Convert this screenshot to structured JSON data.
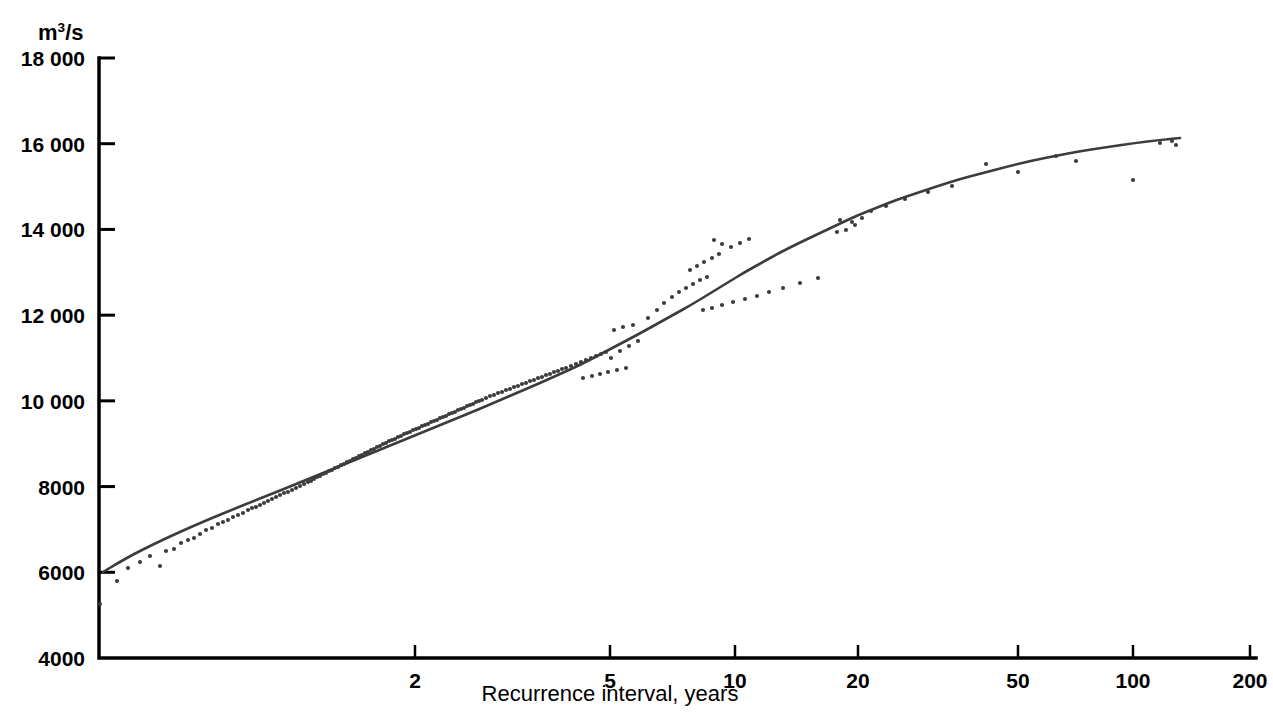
{
  "chart_data": {
    "type": "scatter",
    "title": "",
    "subtitle": "",
    "xlabel": "Recurrence interval, years",
    "ylabel": "m3/s",
    "ylabel_html": "m<sup>3</sup>/s",
    "ylabel_unit_base": "m",
    "ylabel_unit_exp": "3",
    "ylabel_unit_tail": "/s",
    "x_scale": "gumbel-probability",
    "y_scale": "linear",
    "grid": false,
    "legend": null,
    "legend_position": "none",
    "ylim": [
      4000,
      18000
    ],
    "xlim": [
      1.02,
      200
    ],
    "y_ticks": [
      {
        "value": 18000,
        "label": "18 000"
      },
      {
        "value": 16000,
        "label": "16 000"
      },
      {
        "value": 14000,
        "label": "14 000"
      },
      {
        "value": 12000,
        "label": "12 000"
      },
      {
        "value": 10000,
        "label": "10 000"
      },
      {
        "value": 8000,
        "label": "8000"
      },
      {
        "value": 6000,
        "label": "6000"
      },
      {
        "value": 4000,
        "label": "4000"
      }
    ],
    "x_ticks": [
      {
        "value": 2,
        "label": "2",
        "px": 415
      },
      {
        "value": 5,
        "label": "5",
        "px": 610
      },
      {
        "value": 10,
        "label": "10",
        "px": 735
      },
      {
        "value": 20,
        "label": "20",
        "px": 858
      },
      {
        "value": 50,
        "label": "50",
        "px": 1018
      },
      {
        "value": 100,
        "label": "100",
        "px": 1133
      },
      {
        "value": 200,
        "label": "200",
        "px": 1250
      }
    ],
    "series": [
      {
        "name": "Fitted frequency curve",
        "type": "line",
        "color": "#3c3c3c",
        "points_px": [
          [
            103,
            572
          ],
          [
            118,
            563
          ],
          [
            134,
            554
          ],
          [
            152,
            545
          ],
          [
            171,
            536
          ],
          [
            191,
            527
          ],
          [
            212,
            518
          ],
          [
            234,
            509
          ],
          [
            256,
            500
          ],
          [
            279,
            491
          ],
          [
            301,
            482
          ],
          [
            323,
            473
          ],
          [
            345,
            464
          ],
          [
            367,
            455
          ],
          [
            389,
            446
          ],
          [
            411,
            437
          ],
          [
            433,
            428
          ],
          [
            455,
            419
          ],
          [
            477,
            410
          ],
          [
            498,
            401
          ],
          [
            519,
            392
          ],
          [
            540,
            383
          ],
          [
            560,
            374
          ],
          [
            580,
            365
          ],
          [
            599,
            355
          ],
          [
            618,
            345
          ],
          [
            637,
            335
          ],
          [
            655,
            325
          ],
          [
            673,
            315
          ],
          [
            691,
            305
          ],
          [
            709,
            294
          ],
          [
            727,
            283
          ],
          [
            745,
            272
          ],
          [
            763,
            262
          ],
          [
            781,
            252
          ],
          [
            799,
            243
          ],
          [
            818,
            234
          ],
          [
            837,
            225
          ],
          [
            856,
            216
          ],
          [
            876,
            208
          ],
          [
            896,
            200
          ],
          [
            917,
            193
          ],
          [
            938,
            186
          ],
          [
            960,
            179
          ],
          [
            983,
            173
          ],
          [
            1006,
            167
          ],
          [
            1030,
            161
          ],
          [
            1055,
            156
          ],
          [
            1081,
            151
          ],
          [
            1108,
            147
          ],
          [
            1135,
            143
          ],
          [
            1160,
            140
          ],
          [
            1180,
            138
          ]
        ],
        "values_at_xticks": [
          {
            "x": 2,
            "y": 9300
          },
          {
            "x": 5,
            "y": 11790
          },
          {
            "x": 10,
            "y": 13835
          },
          {
            "x": 20,
            "y": 14530
          },
          {
            "x": 50,
            "y": 15370
          },
          {
            "x": 100,
            "y": 15700
          },
          {
            "x": 140,
            "y": 16100
          }
        ],
        "y_start": 6090,
        "y_end": 16120
      },
      {
        "name": "Annual peak discharge observations",
        "type": "scatter",
        "color": "#3c3c3c",
        "marker": "dot",
        "marker_size_px": 3,
        "n_points": 168,
        "points_px": [
          [
            100,
            604
          ],
          [
            117,
            581
          ],
          [
            128,
            568
          ],
          [
            140,
            562
          ],
          [
            150,
            556
          ],
          [
            160,
            566
          ],
          [
            166,
            551
          ],
          [
            174,
            549
          ],
          [
            181,
            543
          ],
          [
            188,
            540
          ],
          [
            194,
            538
          ],
          [
            200,
            534
          ],
          [
            206,
            530
          ],
          [
            212,
            528
          ],
          [
            218,
            524
          ],
          [
            223,
            522
          ],
          [
            228,
            520
          ],
          [
            233,
            517
          ],
          [
            238,
            515
          ],
          [
            243,
            513
          ],
          [
            248,
            510
          ],
          [
            252,
            508
          ],
          [
            256,
            507
          ],
          [
            260,
            505
          ],
          [
            264,
            503
          ],
          [
            268,
            501
          ],
          [
            272,
            499
          ],
          [
            276,
            497
          ],
          [
            280,
            495
          ],
          [
            284,
            493
          ],
          [
            288,
            492
          ],
          [
            292,
            490
          ],
          [
            296,
            488
          ],
          [
            300,
            486
          ],
          [
            304,
            484
          ],
          [
            308,
            482
          ],
          [
            311,
            481
          ],
          [
            314,
            479
          ],
          [
            317,
            477
          ],
          [
            320,
            476
          ],
          [
            323,
            474
          ],
          [
            326,
            473
          ],
          [
            329,
            471
          ],
          [
            332,
            470
          ],
          [
            335,
            468
          ],
          [
            338,
            467
          ],
          [
            341,
            465
          ],
          [
            344,
            464
          ],
          [
            347,
            462
          ],
          [
            350,
            461
          ],
          [
            353,
            459
          ],
          [
            356,
            458
          ],
          [
            359,
            456
          ],
          [
            362,
            455
          ],
          [
            365,
            453
          ],
          [
            368,
            452
          ],
          [
            371,
            450
          ],
          [
            374,
            449
          ],
          [
            377,
            447
          ],
          [
            380,
            446
          ],
          [
            383,
            444
          ],
          [
            386,
            443
          ],
          [
            389,
            441
          ],
          [
            392,
            440
          ],
          [
            395,
            439
          ],
          [
            398,
            437
          ],
          [
            401,
            436
          ],
          [
            404,
            434
          ],
          [
            407,
            433
          ],
          [
            410,
            432
          ],
          [
            413,
            430
          ],
          [
            416,
            429
          ],
          [
            419,
            428
          ],
          [
            422,
            426
          ],
          [
            425,
            425
          ],
          [
            428,
            424
          ],
          [
            431,
            422
          ],
          [
            434,
            421
          ],
          [
            437,
            420
          ],
          [
            440,
            418
          ],
          [
            443,
            417
          ],
          [
            446,
            416
          ],
          [
            449,
            414
          ],
          [
            452,
            413
          ],
          [
            455,
            412
          ],
          [
            458,
            410
          ],
          [
            461,
            409
          ],
          [
            464,
            408
          ],
          [
            467,
            406
          ],
          [
            470,
            405
          ],
          [
            473,
            404
          ],
          [
            476,
            402
          ],
          [
            479,
            401
          ],
          [
            482,
            400
          ],
          [
            486,
            398
          ],
          [
            490,
            396
          ],
          [
            494,
            395
          ],
          [
            498,
            393
          ],
          [
            502,
            392
          ],
          [
            506,
            390
          ],
          [
            510,
            389
          ],
          [
            514,
            387
          ],
          [
            518,
            386
          ],
          [
            522,
            384
          ],
          [
            526,
            383
          ],
          [
            530,
            381
          ],
          [
            534,
            380
          ],
          [
            538,
            378
          ],
          [
            542,
            377
          ],
          [
            546,
            375
          ],
          [
            550,
            374
          ],
          [
            554,
            372
          ],
          [
            558,
            371
          ],
          [
            562,
            369
          ],
          [
            566,
            368
          ],
          [
            571,
            366
          ],
          [
            576,
            364
          ],
          [
            581,
            362
          ],
          [
            586,
            360
          ],
          [
            591,
            358
          ],
          [
            596,
            356
          ],
          [
            601,
            354
          ],
          [
            606,
            352
          ],
          [
            583,
            378
          ],
          [
            592,
            376
          ],
          [
            600,
            374
          ],
          [
            608,
            372
          ],
          [
            617,
            370
          ],
          [
            626,
            368
          ],
          [
            611,
            358
          ],
          [
            620,
            351
          ],
          [
            629,
            346
          ],
          [
            638,
            341
          ],
          [
            614,
            330
          ],
          [
            623,
            327
          ],
          [
            633,
            325
          ],
          [
            648,
            318
          ],
          [
            657,
            310
          ],
          [
            664,
            303
          ],
          [
            672,
            297
          ],
          [
            679,
            292
          ],
          [
            686,
            288
          ],
          [
            693,
            284
          ],
          [
            700,
            280
          ],
          [
            707,
            277
          ],
          [
            690,
            270
          ],
          [
            697,
            266
          ],
          [
            704,
            262
          ],
          [
            712,
            258
          ],
          [
            719,
            254
          ],
          [
            714,
            240
          ],
          [
            722,
            244
          ],
          [
            731,
            247
          ],
          [
            740,
            243
          ],
          [
            749,
            239
          ],
          [
            703,
            310
          ],
          [
            712,
            308
          ],
          [
            722,
            305
          ],
          [
            733,
            302
          ],
          [
            745,
            299
          ],
          [
            757,
            296
          ],
          [
            769,
            292
          ],
          [
            783,
            288
          ],
          [
            800,
            283
          ],
          [
            818,
            278
          ],
          [
            837,
            232
          ],
          [
            846,
            230
          ],
          [
            855,
            225
          ],
          [
            840,
            220
          ],
          [
            862,
            218
          ],
          [
            852,
            222
          ],
          [
            871,
            211
          ],
          [
            886,
            206
          ],
          [
            905,
            199
          ],
          [
            928,
            192
          ],
          [
            952,
            186
          ],
          [
            986,
            164
          ],
          [
            1018,
            172
          ],
          [
            1056,
            156
          ],
          [
            1076,
            161
          ],
          [
            1133,
            180
          ],
          [
            1160,
            143
          ],
          [
            1172,
            141
          ],
          [
            1176,
            145
          ]
        ]
      }
    ],
    "annotations": [],
    "axes_px": {
      "left": 99,
      "right": 1256,
      "top": 58,
      "bottom": 658,
      "y_at_18000": 58,
      "y_at_4000": 658,
      "px_per_2000": 85.7
    },
    "axis_color": "#000000",
    "point_color": "#3c3c3c",
    "line_color": "#3c3c3c",
    "background_color": "#ffffff"
  }
}
